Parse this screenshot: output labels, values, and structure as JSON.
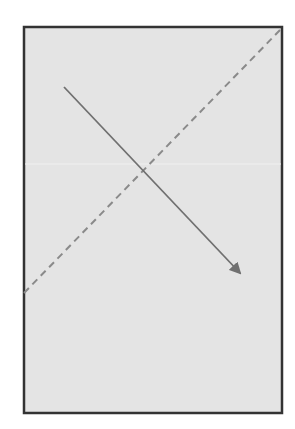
{
  "diagram": {
    "canvas": {
      "width": 295,
      "height": 429,
      "background": "#ffffff"
    },
    "rectangle": {
      "x": 24,
      "y": 27,
      "width": 258,
      "height": 386,
      "fill": "#e4e4e4",
      "stroke": "#333333",
      "stroke_width": 2.5
    },
    "artifact_band": {
      "y": 164,
      "color": "#efefef",
      "opacity": 0.7
    },
    "dashed_line": {
      "x1": 24,
      "y1": 293,
      "x2": 282,
      "y2": 28,
      "stroke": "#8a8a8a",
      "stroke_width": 2,
      "dasharray": "7 5"
    },
    "arrow": {
      "x1": 64,
      "y1": 87,
      "x2": 240,
      "y2": 273,
      "stroke": "#707070",
      "stroke_width": 1.8,
      "head": "filled-triangle"
    }
  }
}
